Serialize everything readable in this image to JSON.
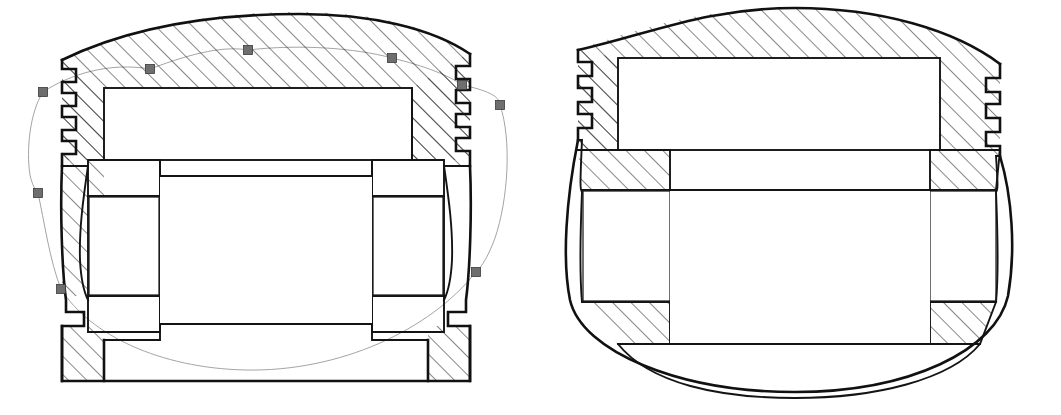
{
  "document": {
    "title": "Piston Cross-Section Deformation Comparison",
    "view_count": 2,
    "background_color": "#ffffff",
    "line_color": "#111111",
    "hatch_color": "#1a1a1a",
    "ghost_outline_color": "#9a9a9a",
    "handle_fill_color": "#6e6e6e",
    "handle_stroke_color": "#3a3a3a"
  },
  "views": [
    {
      "id": "left-view",
      "name": "piston-section-undeformed-selected",
      "label": "Left piston cross-section with selected deformation spline",
      "selected": true,
      "ring_groove_count": 4,
      "has_ghost_overlay": true,
      "has_selection_handles": true,
      "handle_count": 8,
      "crown_shape": "domed",
      "skirt_shape": "waisted"
    },
    {
      "id": "right-view",
      "name": "piston-section-deformed",
      "label": "Right piston cross-section showing deformed profile",
      "selected": false,
      "ring_groove_count": 3,
      "has_ghost_overlay": false,
      "has_selection_handles": false,
      "crown_shape": "bulged-dome",
      "skirt_shape": "barrel-bowed"
    }
  ],
  "selection_handles": [
    {
      "name": "handle-crown-left",
      "x": 43,
      "y": 92,
      "size": 9
    },
    {
      "name": "handle-crown-upper-left",
      "x": 150,
      "y": 69,
      "size": 9
    },
    {
      "name": "handle-crown-top",
      "x": 248,
      "y": 50,
      "size": 9
    },
    {
      "name": "handle-crown-upper-right",
      "x": 392,
      "y": 58,
      "size": 9
    },
    {
      "name": "handle-crown-right",
      "x": 462,
      "y": 85,
      "size": 9
    },
    {
      "name": "handle-skirt-right-upper",
      "x": 500,
      "y": 105,
      "size": 9
    },
    {
      "name": "handle-skirt-left-mid",
      "x": 38,
      "y": 193,
      "size": 9
    },
    {
      "name": "handle-skirt-left-lower",
      "x": 61,
      "y": 289,
      "size": 9
    },
    {
      "name": "handle-skirt-right-lower",
      "x": 476,
      "y": 272,
      "size": 9
    }
  ],
  "geometry_notes": {
    "left_view": {
      "crown_top_apex_y": 14,
      "body_left_x": 62,
      "body_right_x": 470,
      "body_bottom_y": 381,
      "pin_bore_top_y": 175,
      "pin_bore_bottom_y": 325,
      "combustion_bowl_label": "flat-top-crown-cavity"
    },
    "right_view": {
      "crown_top_apex_y": 8,
      "body_left_x": 578,
      "body_right_x": 1000,
      "skirt_bow_bottom_y": 390,
      "pin_bore_top_y": 168,
      "pin_bore_bottom_y": 320
    }
  }
}
